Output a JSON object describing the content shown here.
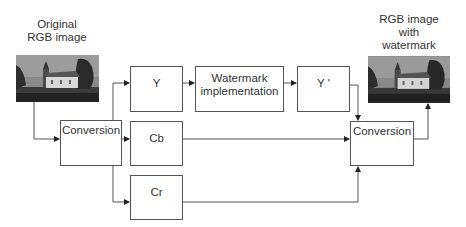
{
  "diagram": {
    "input_caption": [
      "Original",
      "RGB image"
    ],
    "output_caption": [
      "RGB image",
      "with",
      "watermark"
    ],
    "boxes": {
      "conversion_in": "Conversion",
      "y": "Y",
      "watermark": [
        "Watermark",
        "implementation"
      ],
      "y_prime": "Y '",
      "cb": "Cb",
      "cr": "Cr",
      "conversion_out": "Conversion"
    },
    "images": {
      "input": "church-photo-grayscale",
      "output": "church-photo-grayscale-watermarked"
    },
    "colors": {
      "line": "#555555",
      "text": "#333333",
      "background": "#ffffff"
    }
  }
}
